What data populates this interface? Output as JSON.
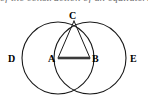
{
  "caption": {
    "text": "of  the  construction  of  an  equilateral",
    "visible": "clipped-bottom-edge-only"
  },
  "figure": {
    "width": 148,
    "height": 102,
    "background_color": "#ffffff",
    "stroke_color": "#1a1a1a",
    "thick_stroke_color": "#3a3a3a",
    "circle_stroke_width": 1.1,
    "line_stroke_width": 1.0,
    "segment_stroke_width": 2.6
  },
  "points": [
    {
      "id": "A",
      "label": "A",
      "x": 58,
      "y": 58,
      "role": "center-of-left-circle"
    },
    {
      "id": "B",
      "label": "B",
      "x": 90,
      "y": 58,
      "role": "center-of-right-circle"
    },
    {
      "id": "C",
      "label": "C",
      "x": 74,
      "y": 21,
      "role": "upper-intersection"
    },
    {
      "id": "F",
      "label": "",
      "x": 74,
      "y": 95,
      "role": "lower-intersection"
    },
    {
      "id": "D",
      "label": "D",
      "x": 22,
      "y": 58,
      "role": "left-extreme-of-left-circle"
    },
    {
      "id": "E",
      "label": "E",
      "x": 126,
      "y": 58,
      "role": "right-extreme-of-right-circle"
    }
  ],
  "circles": [
    {
      "id": "left-circle",
      "cx": 58,
      "cy": 58,
      "r": 36
    },
    {
      "id": "right-circle",
      "cx": 90,
      "cy": 58,
      "r": 36
    }
  ],
  "segments": [
    {
      "id": "segment-CA",
      "from": "C",
      "to": "A",
      "weight": "thin"
    },
    {
      "id": "segment-CB",
      "from": "C",
      "to": "B",
      "weight": "thin"
    },
    {
      "id": "segment-AB",
      "from": "A",
      "to": "B",
      "weight": "thick"
    }
  ],
  "labels": {
    "C": "C",
    "A": "A",
    "B": "B",
    "D": "D",
    "E": "E"
  }
}
